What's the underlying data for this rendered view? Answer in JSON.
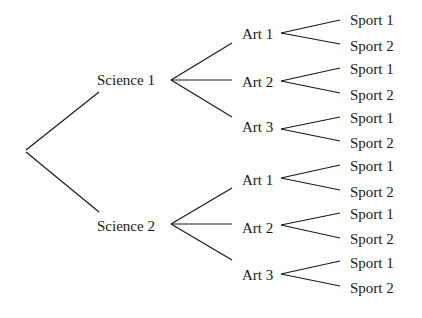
{
  "diagram": {
    "type": "tree",
    "root": "",
    "levels": [
      "Science",
      "Art",
      "Sport"
    ],
    "nodes": {
      "science": [
        {
          "label": "Science 1",
          "x": 97,
          "y": 72,
          "arts": [
            {
              "label": "Art 1",
              "x": 242,
              "y": 26,
              "sports": [
                {
                  "label": "Sport 1",
                  "x": 350,
                  "y": 12
                },
                {
                  "label": "Sport 2",
                  "x": 350,
                  "y": 38
                }
              ]
            },
            {
              "label": "Art 2",
              "x": 242,
              "y": 74,
              "sports": [
                {
                  "label": "Sport 1",
                  "x": 350,
                  "y": 61
                },
                {
                  "label": "Sport 2",
                  "x": 350,
                  "y": 87
                }
              ]
            },
            {
              "label": "Art 3",
              "x": 242,
              "y": 119,
              "sports": [
                {
                  "label": "Sport 1",
                  "x": 350,
                  "y": 110
                },
                {
                  "label": "Sport 2",
                  "x": 350,
                  "y": 135
                }
              ]
            }
          ]
        },
        {
          "label": "Science 2",
          "x": 97,
          "y": 218,
          "arts": [
            {
              "label": "Art 1",
              "x": 242,
              "y": 172,
              "sports": [
                {
                  "label": "Sport 1",
                  "x": 350,
                  "y": 158
                },
                {
                  "label": "Sport 2",
                  "x": 350,
                  "y": 184
                }
              ]
            },
            {
              "label": "Art 2",
              "x": 242,
              "y": 220,
              "sports": [
                {
                  "label": "Sport 1",
                  "x": 350,
                  "y": 206
                },
                {
                  "label": "Sport 2",
                  "x": 350,
                  "y": 231
                }
              ]
            },
            {
              "label": "Art 3",
              "x": 242,
              "y": 267,
              "sports": [
                {
                  "label": "Sport 1",
                  "x": 350,
                  "y": 255
                },
                {
                  "label": "Sport 2",
                  "x": 350,
                  "y": 280
                }
              ]
            }
          ]
        }
      ]
    },
    "line_color": "#1a1a1a",
    "text_color": "#1a1a1a"
  }
}
